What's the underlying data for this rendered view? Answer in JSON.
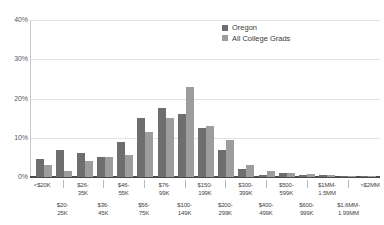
{
  "chart_data": {
    "type": "bar",
    "title": "",
    "subtitle": "",
    "xlabel": "",
    "ylabel": "",
    "ylim": [
      0,
      40
    ],
    "yticks": [
      "0%",
      "10%",
      "20%",
      "30%",
      "40%"
    ],
    "ytick_values": [
      0,
      10,
      20,
      30,
      40
    ],
    "grid": true,
    "legend_position": "top-right",
    "categories": [
      "<$20K",
      "$20-\n25K",
      "$26-\n35K",
      "$36-\n45K",
      "$46-\n55K",
      "$56-\n75K",
      "$76-\n99K",
      "$100-\n149K",
      "$150-\n199K",
      "$200-\n299K",
      "$300-\n399K",
      "$400-\n499K",
      "$500-\n599K",
      "$600-\n999K",
      "$1MM-\n1.5MM",
      "$1.6MM-\n1.99MM",
      ">$2MM"
    ],
    "series": [
      {
        "name": "Oregon",
        "color": "#6e6e6e",
        "values": [
          4.5,
          7.0,
          6.0,
          5.0,
          9.0,
          15.0,
          17.5,
          16.0,
          12.5,
          7.0,
          2.0,
          0.6,
          1.0,
          0.5,
          0.4,
          0.2,
          0.2
        ]
      },
      {
        "name": "All College Grads",
        "color": "#9d9d9d",
        "values": [
          3.0,
          1.5,
          4.0,
          5.0,
          5.5,
          11.5,
          15.0,
          23.0,
          13.0,
          9.5,
          3.0,
          1.5,
          1.0,
          0.8,
          0.5,
          0.3,
          0.2
        ]
      }
    ]
  },
  "legend": {
    "items": [
      {
        "label": "Oregon",
        "color": "#6e6e6e"
      },
      {
        "label": "All College Grads",
        "color": "#9d9d9d"
      }
    ]
  },
  "axis": {
    "y": {
      "ticks": [
        {
          "label": "40%",
          "value": 40
        },
        {
          "label": "30%",
          "value": 30
        },
        {
          "label": "20%",
          "value": 20
        },
        {
          "label": "10%",
          "value": 10
        },
        {
          "label": "0%",
          "value": 0
        }
      ]
    },
    "x": {
      "labels": [
        "<$20K",
        "$20-\n25K",
        "$26-\n35K",
        "$36-\n45K",
        "$46-\n55K",
        "$56-\n75K",
        "$76-\n99K",
        "$100-\n149K",
        "$150-\n199K",
        "$200-\n299K",
        "$300-\n399K",
        "$400-\n499K",
        "$500-\n599K",
        "$600-\n999K",
        "$1MM-\n1.5MM",
        "$1.6MM-\n1.99MM",
        ">$2MM"
      ]
    }
  },
  "colors": {
    "series_oregon": "#6e6e6e",
    "series_all_college_grads": "#9d9d9d",
    "gridline": "#e2e2e2",
    "axis": "#4a4a4a",
    "background": "#ffffff"
  }
}
